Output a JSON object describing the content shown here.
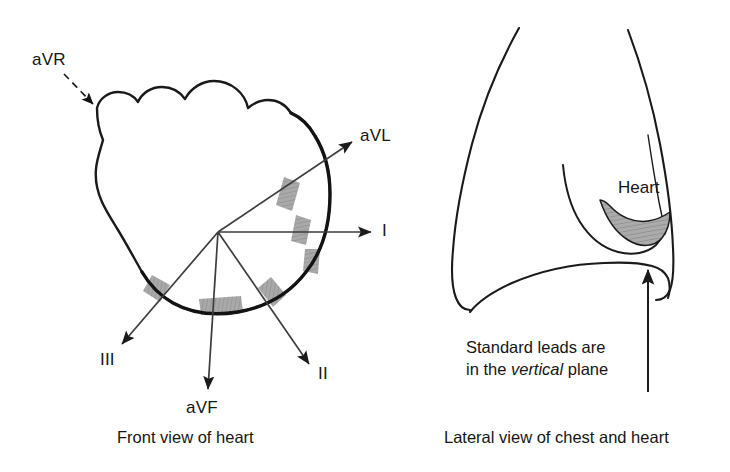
{
  "figure": {
    "colors": {
      "background": "#ffffff",
      "ink": "#111111",
      "outline": "#1a1a1a",
      "lead_segment_gray": "#a8a8a8",
      "segment_hatch": "#8d8d8d",
      "vector_line": "#3c3c3c"
    }
  },
  "left_panel": {
    "caption": "Front view of heart",
    "vector_origin_label": "heart electrical origin",
    "leads": [
      {
        "name": "aVR",
        "label": "aVR",
        "style": "dashed",
        "direction": "upper-left",
        "angle_deg": -150
      },
      {
        "name": "aVL",
        "label": "aVL",
        "style": "solid",
        "direction": "upper-right",
        "angle_deg": -30
      },
      {
        "name": "I",
        "label": "I",
        "style": "solid",
        "direction": "right",
        "angle_deg": 0
      },
      {
        "name": "II",
        "label": "II",
        "style": "solid",
        "direction": "lower-right",
        "angle_deg": 60
      },
      {
        "name": "III",
        "label": "III",
        "style": "solid",
        "direction": "lower-left",
        "angle_deg": 120
      },
      {
        "name": "aVF",
        "label": "aVF",
        "style": "solid",
        "direction": "down",
        "angle_deg": 90
      }
    ],
    "electrode_segments_count": 6
  },
  "right_panel": {
    "caption": "Lateral view of chest and heart",
    "organ_label": "Heart",
    "note": {
      "line1": "Standard leads are",
      "line2_prefix": "in the ",
      "line2_emphasis": "vertical",
      "line2_suffix": " plane"
    },
    "pointer": {
      "name": "vertical-plane-arrow",
      "direction": "up"
    }
  }
}
